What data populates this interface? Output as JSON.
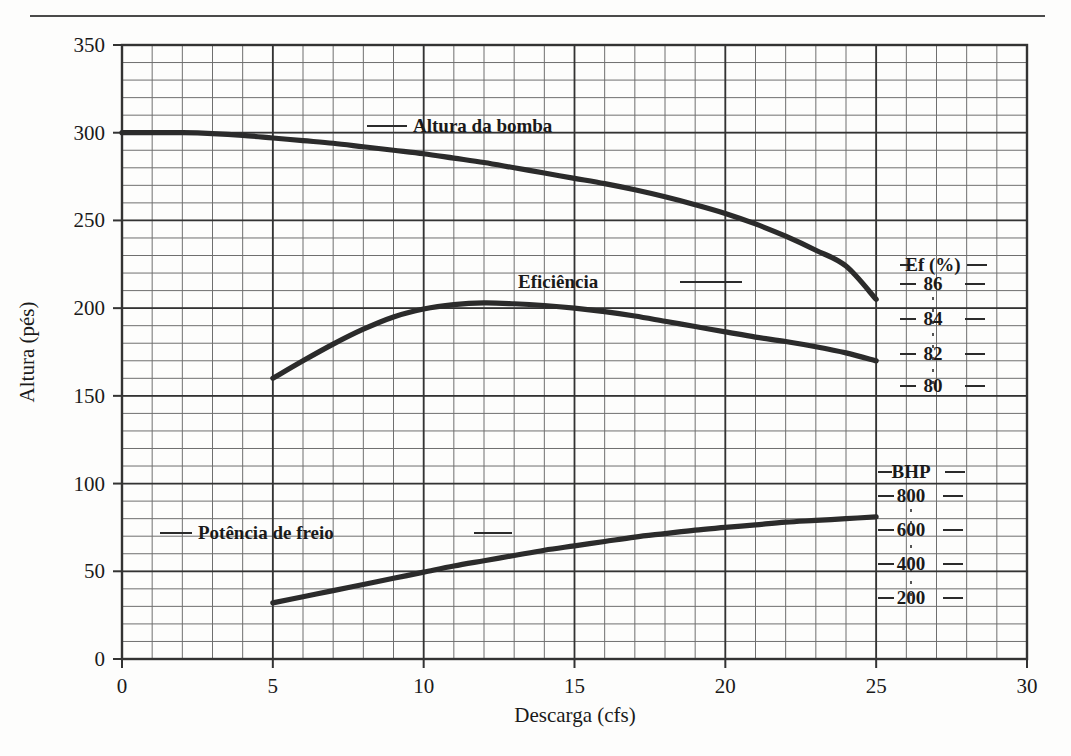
{
  "chart_data": {
    "type": "line",
    "title": "",
    "xlabel": "Descarga (cfs)",
    "ylabel": "Altura (pés)",
    "xlim": [
      0,
      30
    ],
    "ylim": [
      0,
      350
    ],
    "xticks": [
      "0",
      "5",
      "10",
      "15",
      "20",
      "25",
      "30"
    ],
    "xtick_values": [
      0,
      5,
      10,
      15,
      20,
      25,
      30
    ],
    "yticks": [
      "0",
      "50",
      "100",
      "150",
      "200",
      "250",
      "300",
      "350"
    ],
    "ytick_values": [
      0,
      50,
      100,
      150,
      200,
      250,
      300,
      350
    ],
    "grid": true,
    "grid_minor_x_step": 1,
    "grid_minor_y_step": 10,
    "legend_position": "inline-annotations",
    "series": [
      {
        "name": "Altura da bomba",
        "label": "Altura da bomba",
        "x": [
          0,
          1,
          2,
          3,
          4,
          5,
          6,
          7,
          8,
          9,
          10,
          11,
          12,
          13,
          14,
          15,
          16,
          17,
          18,
          19,
          20,
          21,
          22,
          23,
          24,
          25
        ],
        "values": [
          300,
          300,
          300,
          299.5,
          298.5,
          297,
          295.5,
          294,
          292,
          290,
          288,
          285.5,
          283,
          280,
          277,
          274,
          271,
          267.5,
          263.5,
          259,
          254,
          248,
          241,
          233,
          224,
          205
        ]
      },
      {
        "name": "Eficiência",
        "label": "Eficiência",
        "x": [
          5,
          6,
          7,
          8,
          9,
          10,
          11,
          12,
          13,
          14,
          15,
          16,
          17,
          18,
          19,
          20,
          21,
          22,
          23,
          24,
          25
        ],
        "values": [
          160,
          170,
          179.5,
          188,
          195,
          199.5,
          202,
          203,
          202.5,
          201.5,
          200,
          198,
          195.5,
          192.5,
          189.5,
          186.5,
          183.5,
          181,
          178,
          174.5,
          170
        ]
      },
      {
        "name": "Potência de freio",
        "label": "Potência de freio",
        "x": [
          5,
          6,
          7,
          8,
          9,
          10,
          11,
          12,
          13,
          14,
          15,
          16,
          17,
          18,
          19,
          20,
          21,
          22,
          23,
          24,
          25
        ],
        "values": [
          32,
          35.5,
          39,
          42.5,
          46,
          49.5,
          53,
          56,
          59,
          62,
          64.5,
          67,
          69.5,
          71.5,
          73.5,
          75,
          76.5,
          78,
          79,
          80,
          81
        ]
      }
    ],
    "secondary_axes": [
      {
        "name": "efficiency-axis",
        "title": "Ef (%)",
        "ticks": [
          "86",
          "84",
          "82",
          "80"
        ],
        "tick_values": [
          86,
          84,
          82,
          80
        ]
      },
      {
        "name": "bhp-axis",
        "title": "BHP",
        "ticks": [
          "800",
          "600",
          "400",
          "200"
        ],
        "tick_values": [
          800,
          600,
          400,
          200
        ]
      }
    ],
    "annotations": [
      {
        "text": "Altura da bomba",
        "series": "Altura da bomba"
      },
      {
        "text": "Eficiência",
        "series": "Eficiência"
      },
      {
        "text": "Potência de freio",
        "series": "Potência de freio"
      }
    ]
  },
  "colors": {
    "curve": "#2b2b2b",
    "grid": "#6f6f6f",
    "axis": "#333333",
    "background": "#fdfdfc",
    "text": "#1a1a1a"
  }
}
